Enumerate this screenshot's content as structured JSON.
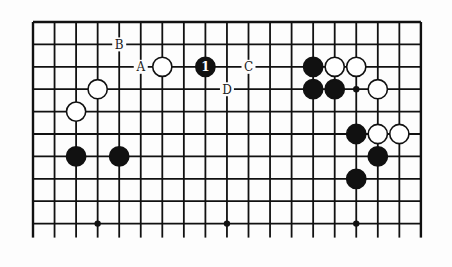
{
  "diagram": {
    "type": "go-board-fragment",
    "columns": 19,
    "rows_shown": 10,
    "edges": {
      "top": true,
      "left": true,
      "right": true,
      "bottom": false
    },
    "hoshi": [
      [
        3,
        9
      ],
      [
        9,
        9
      ],
      [
        15,
        9
      ],
      [
        15,
        3
      ]
    ],
    "stones": [
      {
        "color": "white",
        "col": 6,
        "row": 2
      },
      {
        "color": "black",
        "col": 8,
        "row": 2,
        "label": "1"
      },
      {
        "color": "white",
        "col": 3,
        "row": 3
      },
      {
        "color": "white",
        "col": 2,
        "row": 4
      },
      {
        "color": "black",
        "col": 2,
        "row": 6
      },
      {
        "color": "black",
        "col": 4,
        "row": 6
      },
      {
        "color": "black",
        "col": 13,
        "row": 2
      },
      {
        "color": "white",
        "col": 14,
        "row": 2
      },
      {
        "color": "white",
        "col": 15,
        "row": 2
      },
      {
        "color": "black",
        "col": 13,
        "row": 3
      },
      {
        "color": "black",
        "col": 14,
        "row": 3
      },
      {
        "color": "white",
        "col": 16,
        "row": 3
      },
      {
        "color": "black",
        "col": 15,
        "row": 5
      },
      {
        "color": "white",
        "col": 16,
        "row": 5
      },
      {
        "color": "white",
        "col": 17,
        "row": 5
      },
      {
        "color": "black",
        "col": 16,
        "row": 6
      },
      {
        "color": "black",
        "col": 15,
        "row": 7
      }
    ],
    "markers": [
      {
        "label": "A",
        "col": 5,
        "row": 2
      },
      {
        "label": "B",
        "col": 4,
        "row": 1
      },
      {
        "label": "C",
        "col": 10,
        "row": 2
      },
      {
        "label": "D",
        "col": 9,
        "row": 3
      }
    ]
  }
}
